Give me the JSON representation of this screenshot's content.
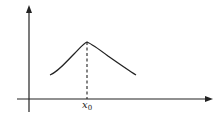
{
  "diagram": {
    "type": "function-maximum-sketch",
    "axes": {
      "x_axis": {
        "y": 99,
        "x_start": 17,
        "x_end": 212,
        "has_arrow": true
      },
      "y_axis": {
        "x": 29,
        "y_start": 112,
        "y_end": 6,
        "has_arrow": true
      }
    },
    "curve": {
      "description": "single-peaked curve rising to a maximum then falling",
      "start": [
        50,
        75
      ],
      "peak": [
        87,
        42
      ],
      "end": [
        136,
        75
      ]
    },
    "dashed_line": {
      "x": 87,
      "y_top": 42,
      "y_bottom": 99
    },
    "labels": {
      "peak_x_main": "x",
      "peak_x_sub": "0"
    },
    "colors": {
      "stroke": "#222222",
      "background": "#ffffff"
    }
  }
}
